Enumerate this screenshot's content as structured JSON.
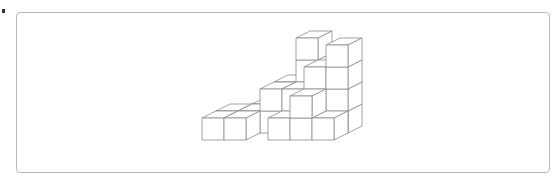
{
  "figure": {
    "line_color": "#8a8a8a",
    "frame_color": "#b8b8b8",
    "cube_count": 26,
    "cubes": [
      {
        "x": 0,
        "y": 0,
        "z": 0
      },
      {
        "x": 1,
        "y": 0,
        "z": 0
      },
      {
        "x": 0,
        "y": 1,
        "z": 0
      },
      {
        "x": 1,
        "y": 1,
        "z": 0
      },
      {
        "x": 2,
        "y": 1,
        "z": 0
      },
      {
        "x": 2,
        "y": 1,
        "z": 1
      },
      {
        "x": 1,
        "y": 2,
        "z": 0
      },
      {
        "x": 2,
        "y": 2,
        "z": 0
      },
      {
        "x": 2,
        "y": 2,
        "z": 1
      },
      {
        "x": 3,
        "y": 2,
        "z": 0
      },
      {
        "x": 3,
        "y": 2,
        "z": 1
      },
      {
        "x": 3,
        "y": 2,
        "z": 2
      },
      {
        "x": 3,
        "y": 2,
        "z": 3
      },
      {
        "x": 3,
        "y": 0,
        "z": 0
      },
      {
        "x": 3,
        "y": 1,
        "z": 0
      },
      {
        "x": 3,
        "y": 1,
        "z": 1
      },
      {
        "x": 4,
        "y": 1,
        "z": 0
      },
      {
        "x": 4,
        "y": 1,
        "z": 1
      },
      {
        "x": 4,
        "y": 1,
        "z": 2
      },
      {
        "x": 4,
        "y": 0,
        "z": 0
      },
      {
        "x": 4,
        "y": 0,
        "z": 1
      },
      {
        "x": 5,
        "y": 1,
        "z": 0
      },
      {
        "x": 5,
        "y": 1,
        "z": 1
      },
      {
        "x": 5,
        "y": 1,
        "z": 2
      },
      {
        "x": 5,
        "y": 1,
        "z": 3
      },
      {
        "x": 5,
        "y": 0,
        "z": 0
      }
    ]
  }
}
